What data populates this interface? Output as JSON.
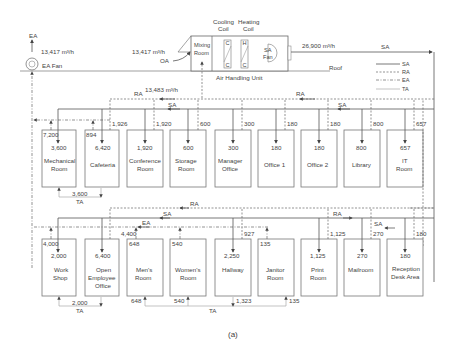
{
  "figure": {
    "caption": "(a)",
    "ahu": {
      "label": "Air Handling Unit",
      "mixing_room": [
        "Mixing",
        "Room"
      ],
      "cooling_coil": [
        "Cooling",
        "Coil"
      ],
      "heating_coil": [
        "Heating",
        "Coil"
      ],
      "coil_c": "C",
      "coil_h": "H",
      "sa_fan": [
        "SA",
        "Fan"
      ],
      "oa_label": "OA",
      "oa_flow": "13,417 m³/h",
      "return_flow": "13,483 m³/h",
      "supply_flow": "26,900 m³/h"
    },
    "ea_fan": {
      "label": "EA Fan",
      "ea_label": "EA",
      "flow": "13,417 m³/h"
    },
    "roof_label": "Roof",
    "legend": [
      {
        "label": "SA",
        "style": "solid"
      },
      {
        "label": "RA",
        "style": "dashed"
      },
      {
        "label": "EA",
        "style": "dash-dot"
      },
      {
        "label": "TA",
        "style": "thin-light"
      }
    ],
    "duct_labels": {
      "ra": "RA",
      "sa": "SA",
      "ea": "EA",
      "ta": "TA"
    },
    "upper_rooms": [
      {
        "name": [
          "Mechanical",
          "Room"
        ],
        "supply": "3,600",
        "return": "7,200"
      },
      {
        "name": [
          "Cafeteria"
        ],
        "supply": "6,420",
        "return": "894"
      },
      {
        "name": [
          "Conference",
          "Room"
        ],
        "supply": "1,920",
        "return": "1,926"
      },
      {
        "name": [
          "Storage",
          "Room"
        ],
        "supply": "600",
        "return": "1,920"
      },
      {
        "name": [
          "Manager",
          "Office"
        ],
        "supply": "300",
        "return": "600"
      },
      {
        "name": [
          "Office 1"
        ],
        "supply": "180",
        "return": "300"
      },
      {
        "name": [
          "Office 2"
        ],
        "supply": "180",
        "return": "180"
      },
      {
        "name": [
          "Library"
        ],
        "supply": "800",
        "return": "180"
      },
      {
        "name": [
          "IT",
          "Room"
        ],
        "supply": "657",
        "return": "800"
      }
    ],
    "upper_extra_return": "657",
    "upper_transfer": "3,600",
    "lower_rooms": [
      {
        "name": [
          "Work",
          "Shop"
        ],
        "supply": "2,000",
        "return": "4,000"
      },
      {
        "name": [
          "Open",
          "Employee",
          "Office"
        ],
        "supply": "6,400",
        "return": "4,400"
      },
      {
        "name": [
          "Men's",
          "Room"
        ],
        "supply": "648",
        "return": ""
      },
      {
        "name": [
          "Women's",
          "Room"
        ],
        "supply": "540",
        "return": ""
      },
      {
        "name": [
          "Hallway"
        ],
        "supply": "2,250",
        "return": "927"
      },
      {
        "name": [
          "Janitor",
          "Room"
        ],
        "supply": "135",
        "return": ""
      },
      {
        "name": [
          "Print",
          "Room"
        ],
        "supply": "1,125",
        "return": "1,125"
      },
      {
        "name": [
          "Mailroom"
        ],
        "supply": "270",
        "return": "270"
      },
      {
        "name": [
          "Reception",
          "Desk Area"
        ],
        "supply": "180",
        "return": "180"
      }
    ],
    "lower_transfer": {
      "workshop": "2,000",
      "mens": "648",
      "womens": "540",
      "hallway": "1,323",
      "janitor": "135"
    }
  }
}
